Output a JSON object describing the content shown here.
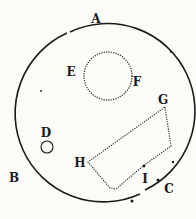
{
  "diagram": {
    "labels": {
      "A": "A",
      "B": "B",
      "C": "C",
      "D": "D",
      "E": "E",
      "F": "F",
      "G": "G",
      "H": "H",
      "I": "I"
    },
    "colors": {
      "ink": "#1a1a1a",
      "paper": "#fbfbf8"
    }
  }
}
